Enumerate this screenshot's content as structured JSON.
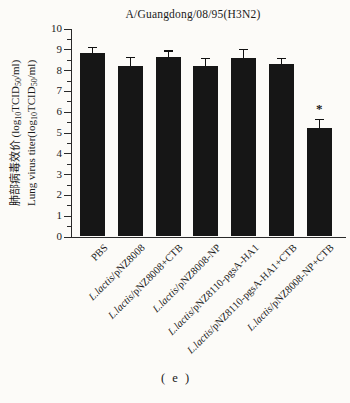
{
  "figure": {
    "panel_label": "( e )"
  },
  "chart_data": {
    "type": "bar",
    "title": "A/Guangdong/08/95(H3N2)",
    "ylabel_lines": [
      "肺部病毒效价 (log~10~TCID~50~/ml)",
      "Lung virus titer(log~10~TCID~50~/ml)"
    ],
    "categories": [
      {
        "italic": "",
        "text": "PBS"
      },
      {
        "italic": "L.lactis",
        "text": "/pNZ8008"
      },
      {
        "italic": "L.lactis",
        "text": "/pNZ8008+CTB"
      },
      {
        "italic": "L.lactis",
        "text": "/pNZ8008-NP"
      },
      {
        "italic": "L.lactis",
        "text": "/pNZ8110-pgsA-HA1"
      },
      {
        "italic": "L.lactis",
        "text": "/pNZ8110-pgsA-HA1+CTB"
      },
      {
        "italic": "L.lactis",
        "text": "/pNZ8008-NP+CTB"
      }
    ],
    "values": [
      8.8,
      8.2,
      8.65,
      8.2,
      8.6,
      8.3,
      5.2
    ],
    "errors": [
      0.3,
      0.45,
      0.3,
      0.4,
      0.4,
      0.3,
      0.45
    ],
    "annotations": [
      {
        "bar_index": 6,
        "symbol": "*"
      }
    ],
    "ylim": [
      0,
      10
    ],
    "ytick_step": 1,
    "yminor_step": 0.5,
    "legend": null,
    "grid": false,
    "bar_color": "#161616",
    "axis_color": "#2a2a2a",
    "background": "#fcfbf8"
  }
}
